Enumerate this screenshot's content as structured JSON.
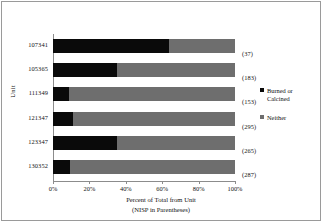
{
  "chart_data": {
    "type": "bar",
    "orientation": "horizontal",
    "stacked": true,
    "normalized_percent": true,
    "title": "",
    "xlabel": "Percent of Total from Unit",
    "xlabel_line2": "(NISP in Parentheses)",
    "ylabel": "Unit",
    "categories": [
      "107341",
      "105365",
      "111349",
      "121347",
      "123347",
      "130352"
    ],
    "point_labels": [
      "(37)",
      "(183)",
      "(153)",
      "(295)",
      "(265)",
      "(287)"
    ],
    "series": [
      {
        "name": "Burned or Calcined",
        "color": "#0a0a0a",
        "values": [
          64,
          35,
          9,
          11,
          35,
          9.5
        ]
      },
      {
        "name": "Neither",
        "color": "#6e6e6e",
        "values": [
          36,
          65,
          91,
          89,
          65,
          90.5
        ]
      }
    ],
    "xlim": [
      0,
      100
    ],
    "xticks": [
      "0%",
      "20%",
      "40%",
      "60%",
      "80%",
      "100%"
    ],
    "xtick_values": [
      0,
      20,
      40,
      60,
      80,
      100
    ],
    "grid": false,
    "legend_position": "right"
  },
  "legend": {
    "items": [
      {
        "label_line1": "Burned or",
        "label_line2": "Calcined"
      },
      {
        "label_line1": "Neither",
        "label_line2": ""
      }
    ]
  }
}
